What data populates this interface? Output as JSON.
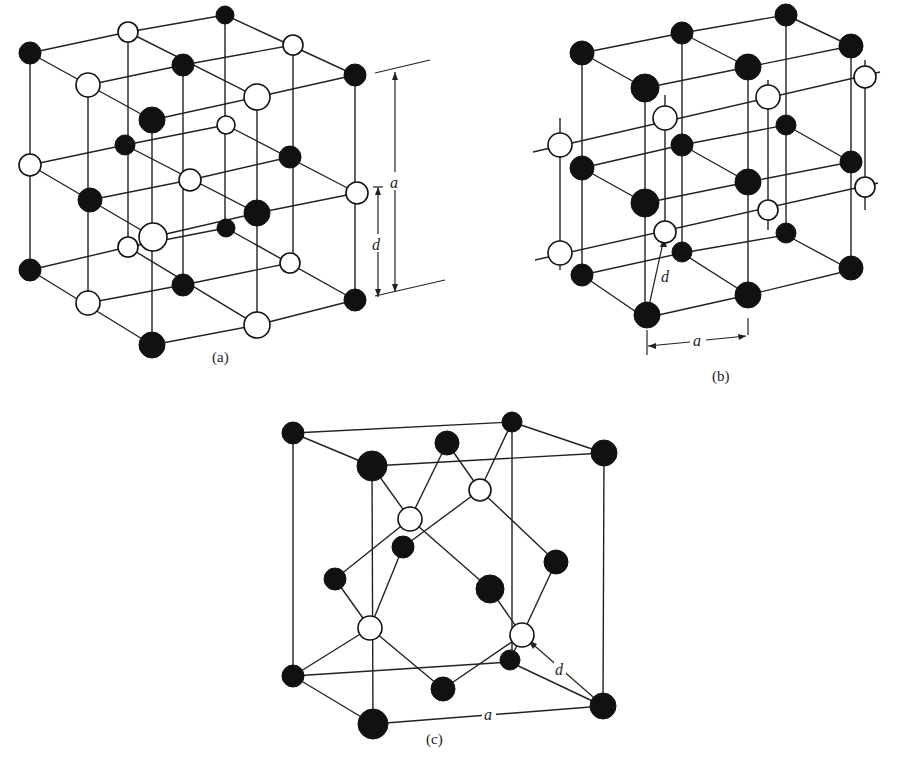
{
  "figure": {
    "panels": [
      {
        "id": "a",
        "caption": "(a)",
        "dimension_labels": {
          "lattice": "a",
          "spacing": "d"
        },
        "structure": "rock-salt (NaCl) lattice of alternating black and white atoms"
      },
      {
        "id": "b",
        "caption": "(b)",
        "dimension_labels": {
          "lattice": "a",
          "spacing": "d"
        },
        "structure": "body-centered cubic arrangement (CsCl-type), black and white atoms"
      },
      {
        "id": "c",
        "caption": "(c)",
        "dimension_labels": {
          "lattice": "a",
          "spacing": "d"
        },
        "structure": "zinc-blende / diamond cubic cell with tetrahedral bonds"
      }
    ],
    "atom_colors": {
      "black": "#111111",
      "white": "#ffffff"
    }
  }
}
